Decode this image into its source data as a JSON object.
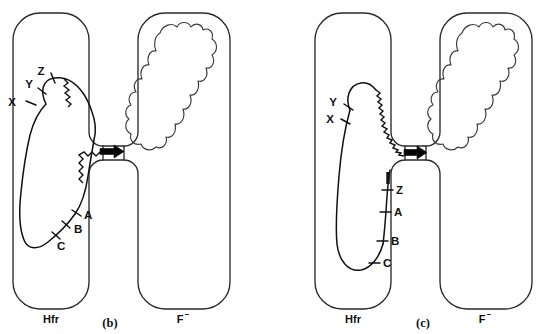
{
  "figure": {
    "type": "bacterial-conjugation-diagram",
    "background_color": "#ffffff",
    "line_color": "#111111",
    "panel_count": 2
  },
  "panels": [
    {
      "id": "b",
      "caption": "(b)",
      "donor": {
        "label": "Hfr",
        "chromosome_state": "closed circular loop with nicked origin",
        "markers": [
          {
            "name": "X",
            "position": "upper-left"
          },
          {
            "name": "Y",
            "position": "upper-left"
          },
          {
            "name": "Z",
            "position": "loop-apex"
          },
          {
            "name": "A",
            "position": "lower-right"
          },
          {
            "name": "B",
            "position": "lower-right"
          },
          {
            "name": "C",
            "position": "loop-bottom"
          }
        ],
        "features": [
          {
            "name": "zigzag-after-Z",
            "meaning": "unwound single strand"
          },
          {
            "name": "zigzag-to-bridge",
            "meaning": "transferring strand"
          }
        ]
      },
      "recipient": {
        "label": "F",
        "superscript": "−",
        "nucleoid": "irregular lobed blob"
      },
      "transfer_arrow": {
        "direction": "right",
        "present": true
      }
    },
    {
      "id": "c",
      "caption": "(c)",
      "donor": {
        "label": "Hfr",
        "chromosome_state": "open linearized strand entering bridge",
        "markers": [
          {
            "name": "Y",
            "position": "upper-left"
          },
          {
            "name": "X",
            "position": "upper-left"
          },
          {
            "name": "Z",
            "position": "right-limb-top"
          },
          {
            "name": "A",
            "position": "right-limb"
          },
          {
            "name": "B",
            "position": "right-limb"
          },
          {
            "name": "C",
            "position": "right-limb-bottom"
          }
        ],
        "features": [
          {
            "name": "origin-bar",
            "meaning": "F factor origin, thick bar above Z"
          },
          {
            "name": "long-zigzag",
            "meaning": "single strand crossing bridge"
          }
        ]
      },
      "recipient": {
        "label": "F",
        "superscript": "−",
        "nucleoid": "irregular lobed blob"
      },
      "transfer_arrow": {
        "direction": "right",
        "present": true
      }
    }
  ],
  "labels": {
    "hfr": "Hfr",
    "f_minus_base": "F",
    "f_minus_sup": "−",
    "marker_X": "X",
    "marker_Y": "Y",
    "marker_Z": "Z",
    "marker_A": "A",
    "marker_B": "B",
    "marker_C": "C",
    "caption_b": "(b)",
    "caption_c": "(c)"
  }
}
